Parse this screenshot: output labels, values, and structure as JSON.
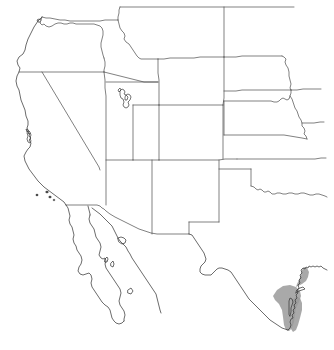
{
  "figure": {
    "name": "western-united-states-outline-map",
    "kind": "outline-map",
    "description": "Line outline map of the western United States with state boundaries, northern Mexico and the Baja California peninsula",
    "background_color": "#ffffff",
    "line_color": "#3a3a3a",
    "boundary_color": "#4a4a4a",
    "shaded_color": "#9a9a9a",
    "width": 334,
    "height": 350,
    "labels_visible": false
  },
  "regions": {
    "states": [
      {
        "id": "oregon",
        "name": "Oregon"
      },
      {
        "id": "idaho",
        "name": "Idaho"
      },
      {
        "id": "california",
        "name": "California"
      },
      {
        "id": "nevada",
        "name": "Nevada"
      },
      {
        "id": "utah",
        "name": "Utah"
      },
      {
        "id": "arizona",
        "name": "Arizona"
      },
      {
        "id": "montana",
        "name": "Montana"
      },
      {
        "id": "wyoming",
        "name": "Wyoming"
      },
      {
        "id": "colorado",
        "name": "Colorado"
      },
      {
        "id": "new-mexico",
        "name": "New Mexico"
      },
      {
        "id": "north-dakota",
        "name": "North Dakota"
      },
      {
        "id": "south-dakota",
        "name": "South Dakota"
      },
      {
        "id": "nebraska",
        "name": "Nebraska"
      },
      {
        "id": "kansas",
        "name": "Kansas"
      },
      {
        "id": "oklahoma",
        "name": "Oklahoma"
      },
      {
        "id": "texas",
        "name": "Texas"
      }
    ],
    "other": [
      {
        "id": "baja-california",
        "name": "Baja California Peninsula"
      },
      {
        "id": "mexico-mainland",
        "name": "Mainland Mexico Coast"
      },
      {
        "id": "great-salt-lake",
        "name": "Great Salt Lake"
      },
      {
        "id": "channel-islands",
        "name": "Channel Islands"
      },
      {
        "id": "gulf-shaded-area",
        "name": "Shaded Gulf Coast Area"
      }
    ]
  }
}
